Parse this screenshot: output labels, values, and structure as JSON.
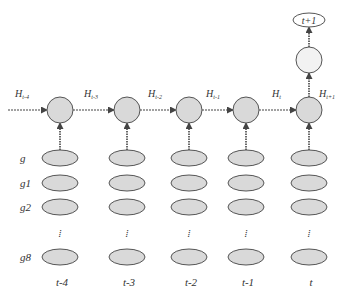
{
  "diagram": {
    "hidden_states": [
      "H_{t-4}",
      "H_{t-3}",
      "H_{t-2}",
      "H_{t-1}",
      "H_t",
      "H_{t+1}"
    ],
    "hidden_labels": [
      {
        "main": "H",
        "sub": "t-4"
      },
      {
        "main": "H",
        "sub": "t-3"
      },
      {
        "main": "H",
        "sub": "t-2"
      },
      {
        "main": "H",
        "sub": "t-1"
      },
      {
        "main": "H",
        "sub": "t"
      },
      {
        "main": "H",
        "sub": "t+1"
      }
    ],
    "output_label": "t+1",
    "row_labels": [
      "g",
      "g1",
      "g2",
      "g8"
    ],
    "ellipsis_symbol": "⁞",
    "time_steps": [
      "t-4",
      "t-3",
      "t-2",
      "t-1",
      "t"
    ],
    "colors": {
      "node_fill": "#d9d9d9",
      "node_stroke": "#555555",
      "upper_node_fill": "#f2f2f2",
      "arrow": "#444444"
    }
  }
}
